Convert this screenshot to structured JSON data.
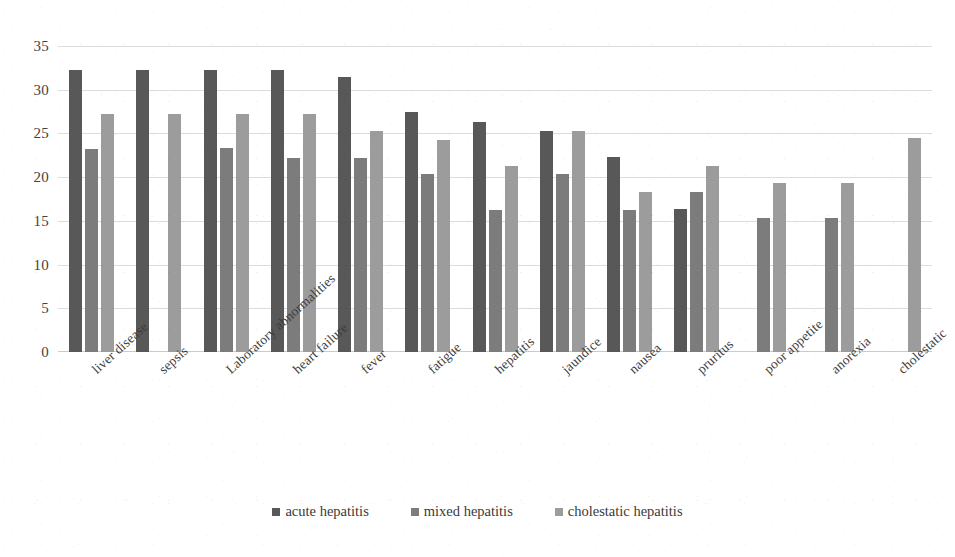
{
  "chart_data": {
    "type": "bar",
    "title": "",
    "subtitle": "",
    "xlabel": "",
    "ylabel": "",
    "ylim": [
      0,
      35
    ],
    "yticks": [
      0,
      5,
      10,
      15,
      20,
      25,
      30,
      35
    ],
    "grid": true,
    "legend_position": "bottom",
    "categories": [
      "liver disease",
      "sepsis",
      "Laboratory abnormalities",
      "heart failure",
      "fever",
      "fatigue",
      "hepatitis",
      "jaundice",
      "nausea",
      "pruritus",
      "poor appetite",
      "anorexia",
      "cholestatic"
    ],
    "series": [
      {
        "name": "acute hepatitis",
        "color": "#585858",
        "values": [
          32.2,
          32.2,
          32.3,
          32.3,
          31.4,
          27.4,
          26.3,
          25.3,
          22.3,
          16.4,
          null,
          null,
          null
        ]
      },
      {
        "name": "mixed hepatitis",
        "color": "#7c7c7c",
        "values": [
          23.2,
          null,
          23.3,
          22.2,
          22.2,
          20.4,
          16.3,
          20.4,
          16.3,
          18.3,
          15.3,
          15.3,
          null
        ]
      },
      {
        "name": "cholestatic hepatitis",
        "color": "#9c9c9c",
        "values": [
          27.2,
          27.2,
          27.2,
          27.2,
          25.3,
          24.3,
          21.3,
          25.3,
          18.3,
          21.3,
          19.3,
          19.3,
          24.5
        ]
      }
    ]
  },
  "legend": {
    "items": [
      {
        "label": "acute hepatitis",
        "marker": "square-swatch-dark"
      },
      {
        "label": "mixed hepatitis",
        "marker": "square-swatch-mid"
      },
      {
        "label": "cholestatic hepatitis",
        "marker": "square-swatch-light"
      }
    ]
  },
  "colors": {
    "series_acute": "#585858",
    "series_mixed": "#7c7c7c",
    "series_cholestatic": "#9c9c9c",
    "gridline": "#d9dde2",
    "text": "#3a3a3a",
    "background": "#ffffff"
  }
}
